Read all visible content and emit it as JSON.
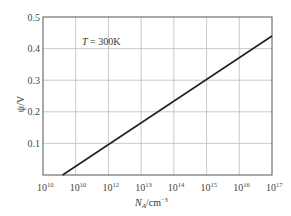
{
  "chart_data": {
    "type": "line",
    "title": "",
    "annotation": "T = 300K",
    "annotation_parts": {
      "var": "T",
      "rest": " = 300K"
    },
    "xlabel": "N_A/cm^-3",
    "xlabel_parts": {
      "base": "N",
      "sub": "A",
      "unit": "/cm",
      "sup": "−3"
    },
    "ylabel": "ψ/V",
    "x_scale": "log",
    "xlim": [
      10000000000.0,
      1e+17
    ],
    "ylim": [
      0,
      0.5
    ],
    "grid": true,
    "x_ticks": [
      {
        "base": "10",
        "exp": "10"
      },
      {
        "base": "10",
        "exp": "10"
      },
      {
        "base": "10",
        "exp": "12"
      },
      {
        "base": "10",
        "exp": "13"
      },
      {
        "base": "10",
        "exp": "14"
      },
      {
        "base": "10",
        "exp": "15"
      },
      {
        "base": "10",
        "exp": "16"
      },
      {
        "base": "10",
        "exp": "17"
      }
    ],
    "y_ticks": [
      "0.1",
      "0.2",
      "0.3",
      "0.4",
      "0.5"
    ],
    "series": [
      {
        "name": "ψ vs N_A",
        "x_log10": [
          10.6,
          17.0
        ],
        "y": [
          0.0,
          0.44
        ]
      }
    ],
    "line_color": "#222222",
    "grid_color": "#bdbdbd"
  }
}
